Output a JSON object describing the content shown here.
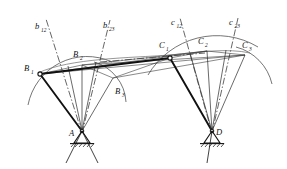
{
  "diagram": {
    "type": "kinematic-linkage-diagram",
    "colors": {
      "stroke": "#1a1a1a",
      "thin": "#555555",
      "background": "#ffffff"
    },
    "labels": {
      "b12": "b",
      "b12_sub": "12",
      "b23": "b",
      "b23_sub": "23",
      "c12": "c",
      "c12_sub": "12",
      "c23": "c",
      "c23_sub": "23",
      "B1": "B",
      "B1_sub": "1",
      "B2": "B",
      "B2_sub": "2",
      "B3": "B",
      "B3_sub": "3",
      "C1": "C",
      "C1_sub": "1",
      "C2": "C",
      "C2_sub": "2",
      "C3": "C",
      "C3_sub": "3",
      "A": "A",
      "D": "D"
    },
    "points": {
      "A": {
        "x": 82,
        "y": 131
      },
      "D": {
        "x": 212,
        "y": 131
      },
      "B1": {
        "x": 40,
        "y": 74
      },
      "B2": {
        "x": 82,
        "y": 65
      },
      "B3": {
        "x": 113,
        "y": 78
      },
      "C1": {
        "x": 170,
        "y": 58
      },
      "C2": {
        "x": 207,
        "y": 51
      },
      "C3": {
        "x": 245,
        "y": 55
      }
    }
  }
}
